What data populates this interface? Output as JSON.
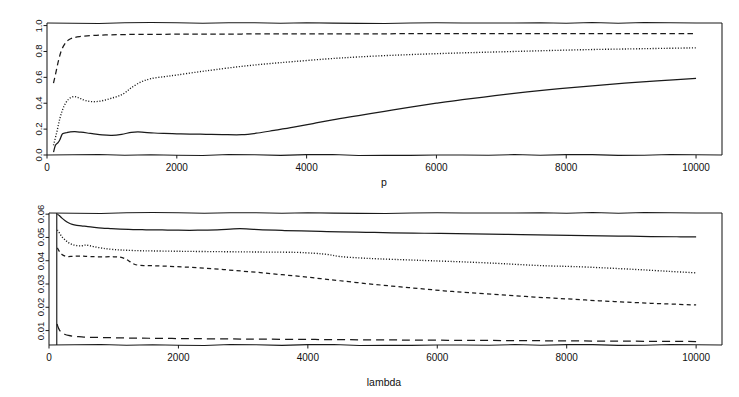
{
  "figure": {
    "background": "#ffffff",
    "ink": "#1a1a1a",
    "panel_count": 2
  },
  "chart_data": [
    {
      "id": "top",
      "type": "line",
      "title": "",
      "xlabel": "p",
      "ylabel": "",
      "xlim": [
        0,
        10400
      ],
      "ylim": [
        0.0,
        1.02
      ],
      "grid": false,
      "legend": "none",
      "xticks": [
        0,
        2000,
        4000,
        6000,
        8000,
        10000
      ],
      "xticklabels": [
        "0",
        "2000",
        "4000",
        "6000",
        "8000",
        "10000"
      ],
      "yticks": [
        0.0,
        0.2,
        0.4,
        0.6,
        0.8,
        1.0
      ],
      "yticklabels": [
        "0.0",
        "0.2",
        "0.4",
        "0.6",
        "0.8",
        "1.0"
      ],
      "series": [
        {
          "name": "upper-dashed",
          "style": "dashed",
          "x": [
            100,
            140,
            180,
            220,
            270,
            330,
            400,
            500,
            620,
            760,
            900,
            1100,
            1400,
            1800,
            2300,
            3000,
            3800,
            4600,
            5400,
            6200,
            7000,
            7800,
            8600,
            9300,
            10000
          ],
          "y": [
            0.555,
            0.645,
            0.735,
            0.805,
            0.855,
            0.888,
            0.905,
            0.915,
            0.921,
            0.925,
            0.928,
            0.93,
            0.932,
            0.933,
            0.934,
            0.935,
            0.936,
            0.936,
            0.937,
            0.937,
            0.937,
            0.938,
            0.938,
            0.938,
            0.938
          ]
        },
        {
          "name": "middle-dotted",
          "style": "dotted",
          "x": [
            100,
            150,
            200,
            260,
            330,
            400,
            460,
            520,
            600,
            700,
            800,
            900,
            1000,
            1100,
            1200,
            1300,
            1450,
            1600,
            1800,
            2000,
            2300,
            2600,
            3000,
            3400,
            3800,
            4300,
            4800,
            5400,
            6000,
            6600,
            7200,
            7800,
            8400,
            9000,
            9500,
            10000
          ],
          "y": [
            0.075,
            0.175,
            0.285,
            0.375,
            0.43,
            0.45,
            0.447,
            0.435,
            0.42,
            0.412,
            0.415,
            0.425,
            0.44,
            0.455,
            0.48,
            0.52,
            0.565,
            0.59,
            0.605,
            0.618,
            0.64,
            0.66,
            0.685,
            0.705,
            0.722,
            0.742,
            0.758,
            0.772,
            0.783,
            0.792,
            0.8,
            0.808,
            0.815,
            0.82,
            0.824,
            0.828
          ]
        },
        {
          "name": "lower-solid",
          "style": "solid",
          "x": [
            100,
            130,
            170,
            200,
            230,
            260,
            300,
            360,
            430,
            520,
            620,
            720,
            850,
            1000,
            1150,
            1300,
            1400,
            1500,
            1650,
            1800,
            2000,
            2200,
            2450,
            2700,
            3000,
            3250,
            3500,
            3800,
            4100,
            4400,
            4800,
            5200,
            5600,
            6000,
            6400,
            6900,
            7400,
            7900,
            8400,
            8900,
            9400,
            10000
          ],
          "y": [
            0.022,
            0.075,
            0.095,
            0.12,
            0.158,
            0.168,
            0.172,
            0.178,
            0.18,
            0.176,
            0.17,
            0.163,
            0.155,
            0.152,
            0.16,
            0.175,
            0.178,
            0.175,
            0.17,
            0.167,
            0.164,
            0.162,
            0.16,
            0.158,
            0.157,
            0.17,
            0.19,
            0.215,
            0.243,
            0.272,
            0.305,
            0.338,
            0.37,
            0.4,
            0.428,
            0.458,
            0.487,
            0.512,
            0.535,
            0.555,
            0.572,
            0.592
          ]
        }
      ]
    },
    {
      "id": "bottom",
      "type": "line",
      "title": "",
      "xlabel": "lambda",
      "ylabel": "",
      "xlim": [
        0,
        10400
      ],
      "ylim": [
        0.0038,
        0.0605
      ],
      "grid": false,
      "legend": "none",
      "xticks": [
        0,
        2000,
        4000,
        6000,
        8000,
        10000
      ],
      "xticklabels": [
        "0",
        "2000",
        "4000",
        "6000",
        "8000",
        "10000"
      ],
      "yticks": [
        0.01,
        0.02,
        0.03,
        0.04,
        0.05,
        0.06
      ],
      "yticklabels": [
        "0.01",
        "0.02",
        "0.03",
        "0.04",
        "0.05",
        "0.06"
      ],
      "vline_x": 120,
      "series": [
        {
          "name": "top-solid",
          "style": "solid",
          "x": [
            130,
            160,
            200,
            250,
            300,
            360,
            430,
            500,
            600,
            700,
            820,
            950,
            1100,
            1300,
            1500,
            1750,
            2000,
            2300,
            2600,
            2800,
            2950,
            3100,
            3300,
            3600,
            3900,
            4200,
            4500,
            4900,
            5300,
            5800,
            6300,
            6800,
            7300,
            7800,
            8300,
            8800,
            9300,
            9700,
            10000
          ],
          "y": [
            0.06,
            0.0594,
            0.0583,
            0.0572,
            0.0563,
            0.0556,
            0.0552,
            0.055,
            0.0546,
            0.0543,
            0.054,
            0.0538,
            0.0536,
            0.0534,
            0.0533,
            0.0532,
            0.0531,
            0.0531,
            0.0533,
            0.0536,
            0.0538,
            0.0536,
            0.0533,
            0.053,
            0.0528,
            0.0526,
            0.0524,
            0.0522,
            0.052,
            0.0518,
            0.0516,
            0.0514,
            0.0512,
            0.051,
            0.0508,
            0.0506,
            0.0504,
            0.0503,
            0.0502
          ]
        },
        {
          "name": "second-dotted",
          "style": "dotted",
          "x": [
            130,
            160,
            200,
            250,
            300,
            360,
            430,
            500,
            560,
            620,
            700,
            800,
            900,
            1050,
            1200,
            1400,
            1600,
            1900,
            2200,
            2600,
            3000,
            3400,
            3800,
            4100,
            4300,
            4500,
            4800,
            5100,
            5500,
            5900,
            6400,
            6900,
            7300,
            7700,
            8100,
            8600,
            9100,
            9600,
            10000
          ],
          "y": [
            0.0532,
            0.052,
            0.0503,
            0.0489,
            0.0478,
            0.047,
            0.0465,
            0.0464,
            0.0467,
            0.0465,
            0.046,
            0.0455,
            0.0451,
            0.0447,
            0.0445,
            0.0443,
            0.0442,
            0.0441,
            0.044,
            0.0439,
            0.0438,
            0.0437,
            0.0436,
            0.0432,
            0.0427,
            0.0418,
            0.0412,
            0.0408,
            0.0404,
            0.04,
            0.0395,
            0.0389,
            0.0383,
            0.0378,
            0.0375,
            0.0369,
            0.0362,
            0.0354,
            0.0348
          ]
        },
        {
          "name": "third-short-dashed",
          "style": "shortdash",
          "x": [
            130,
            160,
            200,
            250,
            300,
            360,
            430,
            500,
            560,
            640,
            750,
            880,
            1000,
            1100,
            1180,
            1250,
            1320,
            1400,
            1500,
            1650,
            1850,
            2100,
            2400,
            2700,
            3000,
            3300,
            3600,
            3900,
            4200,
            4500,
            4900,
            5300,
            5700,
            6100,
            6500,
            7000,
            7500,
            8000,
            8500,
            9000,
            9500,
            10000
          ],
          "y": [
            0.0455,
            0.044,
            0.0427,
            0.042,
            0.0418,
            0.0419,
            0.042,
            0.042,
            0.0419,
            0.0418,
            0.0417,
            0.0417,
            0.0417,
            0.0415,
            0.0408,
            0.0396,
            0.0385,
            0.038,
            0.0379,
            0.0378,
            0.0376,
            0.0373,
            0.0368,
            0.0362,
            0.0355,
            0.0348,
            0.034,
            0.0332,
            0.0323,
            0.0314,
            0.0302,
            0.0291,
            0.0281,
            0.0271,
            0.0263,
            0.0253,
            0.0244,
            0.0236,
            0.0228,
            0.0221,
            0.0215,
            0.021
          ]
        },
        {
          "name": "bottom-long-dashed",
          "style": "longdash",
          "x": [
            125,
            140,
            160,
            185,
            215,
            250,
            300,
            360,
            440,
            540,
            650,
            800,
            1000,
            1250,
            1550,
            1900,
            2300,
            2800,
            3300,
            3900,
            4500,
            5100,
            5700,
            6400,
            7100,
            7800,
            8500,
            9200,
            10000
          ],
          "y": [
            0.0128,
            0.0115,
            0.0103,
            0.0094,
            0.0088,
            0.0083,
            0.0079,
            0.0076,
            0.0074,
            0.0072,
            0.0071,
            0.007,
            0.0069,
            0.0068,
            0.0067,
            0.0066,
            0.0065,
            0.0064,
            0.0063,
            0.0062,
            0.0061,
            0.006,
            0.0059,
            0.0058,
            0.0057,
            0.0056,
            0.0055,
            0.0054,
            0.0053
          ]
        }
      ]
    }
  ]
}
